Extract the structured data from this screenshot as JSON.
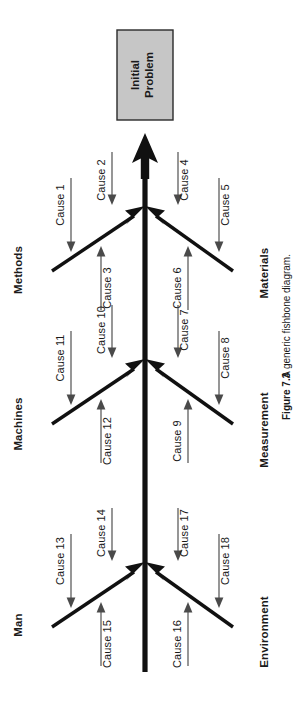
{
  "figure": {
    "number": "Figure 7.3",
    "caption": "A generic fishbone diagram.",
    "title": "A generic fishbone diagram",
    "orientation": "rotated-90-counterclockwise"
  },
  "diagram": {
    "type": "fishbone",
    "head": {
      "label_line1": "Initial",
      "label_line2": "Problem",
      "fill_color": "#c6c6c6",
      "border_color": "#2a2a2a"
    },
    "spine": {
      "color": "#111111",
      "direction": "points-to-head"
    },
    "categories": [
      {
        "name": "Methods",
        "side": "left",
        "junction": 1,
        "causes": [
          "Cause 1",
          "Cause 2",
          "Cause 3"
        ]
      },
      {
        "name": "Materials",
        "side": "right",
        "junction": 1,
        "causes": [
          "Cause 4",
          "Cause 5",
          "Cause 6"
        ]
      },
      {
        "name": "Machines",
        "side": "left",
        "junction": 2,
        "causes": [
          "Cause 10",
          "Cause 11",
          "Cause 12"
        ]
      },
      {
        "name": "Measurement",
        "side": "right",
        "junction": 2,
        "causes": [
          "Cause 7",
          "Cause 8",
          "Cause 9"
        ]
      },
      {
        "name": "Man",
        "side": "left",
        "junction": 3,
        "causes": [
          "Cause 13",
          "Cause 14",
          "Cause 15"
        ]
      },
      {
        "name": "Environment",
        "side": "right",
        "junction": 3,
        "causes": [
          "Cause 16",
          "Cause 17",
          "Cause 18"
        ]
      }
    ],
    "cause_labels": {
      "c1": "Cause 1",
      "c2": "Cause 2",
      "c3": "Cause 3",
      "c4": "Cause 4",
      "c5": "Cause 5",
      "c6": "Cause 6",
      "c7": "Cause 7",
      "c8": "Cause 8",
      "c9": "Cause 9",
      "c10": "Cause 10",
      "c11": "Cause 11",
      "c12": "Cause 12",
      "c13": "Cause 13",
      "c14": "Cause 14",
      "c15": "Cause 15",
      "c16": "Cause 16",
      "c17": "Cause 17",
      "c18": "Cause 18"
    },
    "category_labels": {
      "methods": "Methods",
      "materials": "Materials",
      "machines": "Machines",
      "measurement": "Measurement",
      "man": "Man",
      "environment": "Environment"
    }
  }
}
